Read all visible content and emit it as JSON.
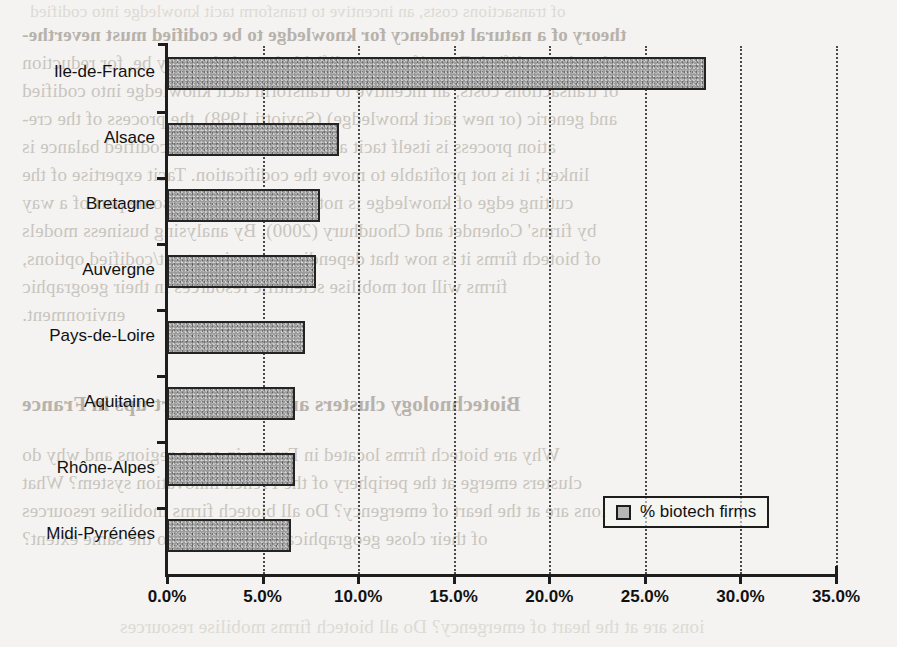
{
  "chart_data": {
    "type": "bar",
    "orientation": "horizontal",
    "title": "",
    "xlabel": "",
    "ylabel": "",
    "categories": [
      "Ile-de-France",
      "Alsace",
      "Bretagne",
      "Auvergne",
      "Pays-de-Loire",
      "Aquitaine",
      "Rhône-Alpes",
      "Midi-Pyrénées"
    ],
    "values": [
      28.2,
      9.0,
      8.0,
      7.8,
      7.2,
      6.7,
      6.7,
      6.5
    ],
    "series": [
      {
        "name": "% biotech firms",
        "values": [
          28.2,
          9.0,
          8.0,
          7.8,
          7.2,
          6.7,
          6.7,
          6.5
        ]
      }
    ],
    "xlim": [
      0,
      35
    ],
    "xticks": [
      0,
      5,
      10,
      15,
      20,
      25,
      30,
      35
    ],
    "xtick_labels": [
      "0.0%",
      "5.0%",
      "10.0%",
      "15.0%",
      "20.0%",
      "25.0%",
      "30.0%",
      "35.0%"
    ],
    "grid": "vertical-dotted",
    "legend": {
      "position": "inside-lower-right",
      "entries": [
        "% biotech firms"
      ]
    },
    "bar_color": "#9b9b9b",
    "bar_border_color": "#242424",
    "axis_color": "#1d1d1d"
  },
  "legend": {
    "label": "% biotech firms",
    "swatch_name": "legend-swatch"
  },
  "background_text": {
    "description": "mirrored bleed-through text from reverse side of scanned page",
    "lines": [
      "theory of a natural tendency for knowledge to be codified must neverthe-",
      "less be qualified. Even if some codifiable knowledge may be, for reduction",
      "of transactions costs, an incentive to transform tacit knowledge into codified",
      "and generic (or new tacit knowledge) (Saviotti 1998), the process of the cre-",
      "ation process is itself tacit and the are of the tacit/codified balance is",
      "linked; it is not profitable to move the codification. Tacit expertise of the",
      "cutting edge of knowledge is not always moving in some part of a way",
      "by firms' Cohendet and Choudhury (2000). By analysing business models",
      "of biotech firms it is now that depending on various tacit/codified options,",
      "firms will not mobilise scientific resources in their geographic",
      "environment.",
      "Biotechnology clusters and biotech start-ups in France",
      "Why are biotech firms located in France in some regions and why do",
      "clusters emerge at the periphery of the French innovation system? What",
      "ions are at the heart of emergency? Do all biotech firms mobilise resources",
      "of their close geographical environment to the same extent?"
    ]
  }
}
